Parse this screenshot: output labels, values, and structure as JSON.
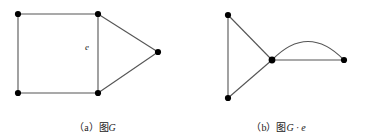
{
  "figure": {
    "background_color": "#ffffff",
    "line_color": "#555555",
    "vertex_color": "#000000",
    "panels": [
      {
        "id": "a",
        "caption_index": "（a）",
        "caption_body": "图",
        "caption_var": "G",
        "caption_full": "（a）图G",
        "edge_label": "e",
        "vertices": [
          {
            "name": "top-left",
            "x": 18,
            "y": 14
          },
          {
            "name": "top-right",
            "x": 98,
            "y": 14
          },
          {
            "name": "bottom-left",
            "x": 18,
            "y": 93
          },
          {
            "name": "bottom-right",
            "x": 98,
            "y": 93
          },
          {
            "name": "right-apex",
            "x": 158,
            "y": 52
          }
        ],
        "edges": [
          {
            "from": "top-left",
            "to": "top-right",
            "type": "line"
          },
          {
            "from": "top-left",
            "to": "bottom-left",
            "type": "line"
          },
          {
            "from": "bottom-left",
            "to": "bottom-right",
            "type": "line"
          },
          {
            "from": "top-right",
            "to": "bottom-right",
            "type": "line",
            "label": "e"
          },
          {
            "from": "top-right",
            "to": "right-apex",
            "type": "line"
          },
          {
            "from": "bottom-right",
            "to": "right-apex",
            "type": "line"
          }
        ]
      },
      {
        "id": "b",
        "caption_index": "（b）",
        "caption_body": "图",
        "caption_var": "G · e",
        "caption_full": "（b）图G · e",
        "edge_label": "",
        "vertices": [
          {
            "name": "top",
            "x": 228,
            "y": 15
          },
          {
            "name": "bottom-left",
            "x": 228,
            "y": 98
          },
          {
            "name": "center",
            "x": 272,
            "y": 60
          },
          {
            "name": "right",
            "x": 344,
            "y": 60
          }
        ],
        "edges": [
          {
            "from": "top",
            "to": "bottom-left",
            "type": "line"
          },
          {
            "from": "top",
            "to": "center",
            "type": "line"
          },
          {
            "from": "bottom-left",
            "to": "center",
            "type": "line"
          },
          {
            "from": "center",
            "to": "right",
            "type": "line"
          },
          {
            "from": "center",
            "to": "right",
            "type": "arc"
          }
        ]
      }
    ]
  }
}
